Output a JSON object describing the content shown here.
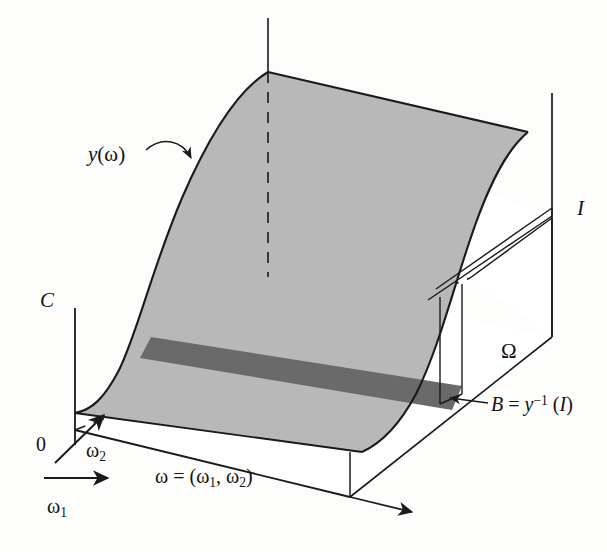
{
  "figure": {
    "type": "3d-surface-diagram",
    "background_color": "#fdfdfc",
    "surface_color": "#b8b8b8",
    "band_color": "#6a6a6a",
    "line_color": "#1a1a1a"
  },
  "labels": {
    "vertical_axis": "C",
    "origin": "0",
    "surface": {
      "base": "y",
      "arg_open": "(",
      "omega": "ω",
      "arg_close": ")"
    },
    "interval": "I",
    "domain_region": "Ω",
    "band": {
      "lhs": "B",
      "equals": "=",
      "fn": "y",
      "exponent": "−1",
      "paren_open": "(",
      "arg": "I",
      "paren_close": ")"
    },
    "axis_w1": {
      "symbol": "ω",
      "subscript": "1"
    },
    "axis_w2": {
      "symbol": "ω",
      "subscript": "2"
    },
    "omega_vector": {
      "symbol": "ω",
      "equals": "=",
      "open": "(",
      "first": "ω",
      "first_sub": "1",
      "comma": ",",
      "second": "ω",
      "second_sub": "2",
      "close": ")"
    }
  },
  "geometry": {
    "surface_front_edge_left": [
      75,
      413
    ],
    "surface_peak_top": [
      268,
      72
    ],
    "surface_top_right": [
      528,
      132
    ],
    "origin_point": [
      75,
      430
    ],
    "c_axis_top": [
      75,
      308
    ],
    "base_right_corner": [
      350,
      497
    ],
    "base_far_corner": [
      552,
      337
    ],
    "right_vertical_line_top": [
      552,
      93
    ],
    "band_left": [
      140,
      360
    ],
    "band_right": [
      462,
      412
    ]
  }
}
